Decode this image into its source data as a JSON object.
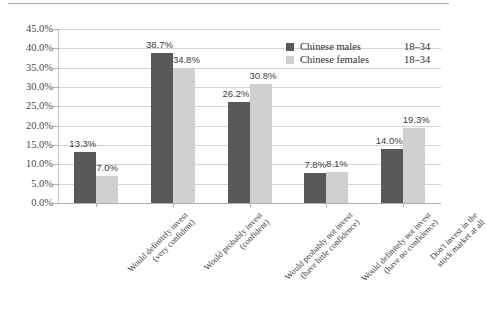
{
  "chart_data": {
    "type": "bar",
    "title": "",
    "subtitle": "",
    "xlabel": "",
    "ylabel": "",
    "ylim": [
      0,
      45
    ],
    "ytick_step": 5,
    "grid": true,
    "legend_position": "top-right",
    "categories": [
      "Would definitely invest\n(very confident)",
      "Would probably invest\n(confident)",
      "Would probably not invest\n(have little confidence)",
      "Would definitely not invest\n(have no confidence)",
      "Don't invest in the\nstock market at all"
    ],
    "categories_lines": [
      [
        "Would definitely invest",
        "(very confident)"
      ],
      [
        "Would probably invest",
        "(confident)"
      ],
      [
        "Would probably not invest",
        "(have little confidence)"
      ],
      [
        "Would definitely not invest",
        "(have no confidence)"
      ],
      [
        "Don't invest in the",
        "stock market at all"
      ]
    ],
    "ytick_labels": [
      "45.0%",
      "40.0%",
      "35.0%",
      "30.0%",
      "25.0%",
      "20.0%",
      "15.0%",
      "10.0%",
      "5.0%",
      "0.0%"
    ],
    "ytick_values": [
      45,
      40,
      35,
      30,
      25,
      20,
      15,
      10,
      5,
      0
    ],
    "series": [
      {
        "name": "Chinese males",
        "age": "18–34",
        "color": "#595959",
        "values": [
          13.3,
          38.7,
          26.2,
          7.8,
          14.0
        ],
        "value_labels": [
          "13.3%",
          "38.7%",
          "26.2%",
          "7.8%",
          "14.0%"
        ]
      },
      {
        "name": "Chinese females",
        "age": "18–34",
        "color": "#d0d0d0",
        "values": [
          7.0,
          34.8,
          30.8,
          8.1,
          19.3
        ],
        "value_labels": [
          "7.0%",
          "34.8%",
          "30.8%",
          "8.1%",
          "19.3%"
        ]
      }
    ]
  },
  "legend": {
    "rows": [
      {
        "name": "Chinese males",
        "age": "18–34"
      },
      {
        "name": "Chinese females",
        "age": "18–34"
      }
    ]
  },
  "colors": {
    "male": "#595959",
    "female": "#d0d0d0",
    "grid": "#d4d4d4",
    "axis": "#b0b0b0",
    "text": "#3a3a3a"
  }
}
